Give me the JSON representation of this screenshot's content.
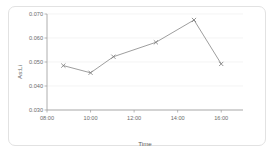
{
  "figure": {
    "background_color": "#ffffff",
    "frame_color": "#e2e2e2",
    "line_color": "#8c8c8c",
    "grid_color": "#efefef",
    "axis_color": "#9a9a9a",
    "text_color": "#6b6b6b"
  },
  "chart_data": {
    "type": "line",
    "title": "",
    "subtitle": "",
    "xlabel": "Time",
    "ylabel": "As:Li",
    "grid": true,
    "legend": false,
    "legend_position": "none",
    "xlim": [
      8.0,
      17.0
    ],
    "ylim": [
      0.03,
      0.07
    ],
    "yticks": [
      0.03,
      0.04,
      0.05,
      0.06,
      0.07
    ],
    "ytick_labels": [
      "0.030",
      "0.040",
      "0.050",
      "0.060",
      "0.070"
    ],
    "xticks": [
      8,
      10,
      12,
      14,
      16
    ],
    "xtick_labels": [
      "08:00",
      "10:00",
      "12:00",
      "14:00",
      "16:00"
    ],
    "marker": "x",
    "x": [
      8.75,
      10.0,
      11.05,
      13.0,
      14.75,
      16.0
    ],
    "x_time_labels": [
      "08:45",
      "10:00",
      "11:03",
      "13:00",
      "14:45",
      "16:00"
    ],
    "values": [
      0.0485,
      0.0455,
      0.0522,
      0.0582,
      0.0675,
      0.0492
    ],
    "series": [
      {
        "name": "As:Li",
        "values": [
          0.0485,
          0.0455,
          0.0522,
          0.0582,
          0.0675,
          0.0492
        ]
      }
    ]
  }
}
